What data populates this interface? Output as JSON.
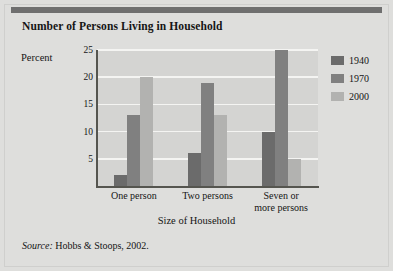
{
  "figure": {
    "title": "Number of Persons Living in Household",
    "source_word": "Source:",
    "source_text": " Hobbs & Stoops, 2002."
  },
  "chart_data": {
    "type": "bar",
    "title": "Number of Persons Living in Household",
    "xlabel": "Size of Household",
    "ylabel": "Percent",
    "categories": [
      "One person",
      "Two persons",
      "Seven or\nmore persons"
    ],
    "series": [
      {
        "name": "1940",
        "color": "#6b6b6b",
        "values": [
          2,
          6,
          10
        ]
      },
      {
        "name": "1970",
        "color": "#808080",
        "values": [
          13,
          19,
          25
        ]
      },
      {
        "name": "2000",
        "color": "#b2b2b0",
        "values": [
          20,
          13,
          5
        ]
      }
    ],
    "ylim": [
      0,
      25
    ],
    "yticks": [
      5,
      10,
      15,
      20,
      25
    ],
    "grid": true,
    "legend_position": "right"
  }
}
